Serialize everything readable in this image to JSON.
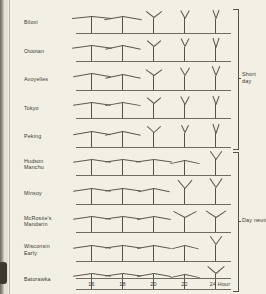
{
  "figure": {
    "x_axis": {
      "label": "Hour",
      "ticks": [
        "16",
        "18",
        "20",
        "22",
        "24"
      ],
      "tick_positions": [
        16,
        18,
        20,
        22,
        24
      ]
    },
    "groups": [
      {
        "id": "short-day",
        "label": "Short\nday",
        "label_line1": "Short",
        "label_line2": "day",
        "row_start": 0,
        "row_end": 4
      },
      {
        "id": "day-neutral",
        "label": "Day neutral",
        "label_line1": "Day neutral",
        "label_line2": "",
        "row_start": 5,
        "row_end": 9
      }
    ],
    "rows": [
      {
        "name": "Biloxi",
        "lines": [
          "Biloxi"
        ],
        "group": "short-day"
      },
      {
        "name": "Otootan",
        "lines": [
          "Otootan"
        ],
        "group": "short-day"
      },
      {
        "name": "Avoyelles",
        "lines": [
          "Avoyelles"
        ],
        "group": "short-day"
      },
      {
        "name": "Tokyo",
        "lines": [
          "Tokyo"
        ],
        "group": "short-day"
      },
      {
        "name": "Peking",
        "lines": [
          "Peking"
        ],
        "group": "short-day"
      },
      {
        "name": "Hudson Manchu",
        "lines": [
          "Hudson",
          "Manchu"
        ],
        "group": "day-neutral"
      },
      {
        "name": "Minsoy",
        "lines": [
          "Minsoy"
        ],
        "group": "day-neutral"
      },
      {
        "name": "McRostie's Mandarin",
        "lines": [
          "McRostie's",
          "Mandarin"
        ],
        "group": "day-neutral"
      },
      {
        "name": "Wisconsin Early",
        "lines": [
          "Wisconsin",
          "Early"
        ],
        "group": "day-neutral"
      },
      {
        "name": "Batorawka",
        "lines": [
          "Batorawka"
        ],
        "group": "day-neutral"
      }
    ]
  },
  "chart_data": {
    "type": "scatter",
    "title": "",
    "subtitle": "",
    "xlabel": "Hour",
    "ylabel": "",
    "x": [
      16,
      18,
      20,
      22,
      24
    ],
    "xticklabels": [
      "16",
      "18",
      "20",
      "22",
      "24"
    ],
    "xlim": [
      15,
      25
    ],
    "grid": false,
    "legend": "none",
    "note": "Plant-habit pictograms: each glyph shows stem height and branch spread for one soybean variety grown under the given photoperiod (hours of daylight). Values: height = relative stem height (0-1), spread = relative branch half-width (0-1), droop = branch tip angle below horizontal in degrees (negative = branches raised upward).",
    "categories": [
      "Biloxi",
      "Otootan",
      "Avoyelles",
      "Tokyo",
      "Peking",
      "Hudson Manchu",
      "Minsoy",
      "McRostie's Mandarin",
      "Wisconsin Early",
      "Batorawka"
    ],
    "series": [
      {
        "name": "Biloxi",
        "group": "short day",
        "height": [
          0.95,
          0.92,
          0.86,
          0.84,
          0.82
        ],
        "spread": [
          1.0,
          0.92,
          0.38,
          0.2,
          0.16
        ],
        "droop": [
          6,
          10,
          -38,
          -62,
          -70
        ]
      },
      {
        "name": "Otootan",
        "group": "short day",
        "height": [
          0.93,
          0.9,
          0.85,
          0.83,
          0.81
        ],
        "spread": [
          0.98,
          0.9,
          0.36,
          0.19,
          0.15
        ],
        "droop": [
          8,
          12,
          -40,
          -64,
          -72
        ]
      },
      {
        "name": "Avoyelles",
        "group": "short day",
        "height": [
          0.92,
          0.9,
          0.84,
          0.82,
          0.8
        ],
        "spread": [
          0.96,
          0.88,
          0.4,
          0.22,
          0.18
        ],
        "droop": [
          10,
          12,
          -36,
          -60,
          -68
        ]
      },
      {
        "name": "Tokyo",
        "group": "short day",
        "height": [
          0.92,
          0.9,
          0.84,
          0.82,
          0.8
        ],
        "spread": [
          0.95,
          0.88,
          0.36,
          0.2,
          0.16
        ],
        "droop": [
          8,
          10,
          -40,
          -62,
          -70
        ]
      },
      {
        "name": "Peking",
        "group": "short day",
        "height": [
          0.9,
          0.89,
          0.83,
          0.8,
          0.78
        ],
        "spread": [
          0.94,
          0.86,
          0.34,
          0.18,
          0.15
        ],
        "droop": [
          10,
          12,
          -42,
          -64,
          -72
        ]
      },
      {
        "name": "Hudson Manchu",
        "group": "day neutral",
        "height": [
          0.9,
          0.9,
          0.89,
          0.88,
          0.92
        ],
        "spread": [
          0.92,
          0.9,
          0.88,
          0.72,
          0.3
        ],
        "droop": [
          8,
          8,
          8,
          12,
          -55
        ]
      },
      {
        "name": "Minsoy",
        "group": "day neutral",
        "height": [
          0.9,
          0.9,
          0.89,
          0.9,
          0.92
        ],
        "spread": [
          0.92,
          0.9,
          0.8,
          0.34,
          0.3
        ],
        "droop": [
          8,
          8,
          12,
          -50,
          -56
        ]
      },
      {
        "name": "McRostie's Mandarin",
        "group": "day neutral",
        "height": [
          0.9,
          0.9,
          0.89,
          0.86,
          0.86
        ],
        "spread": [
          0.92,
          0.9,
          0.86,
          0.56,
          0.48
        ],
        "droop": [
          8,
          8,
          10,
          -28,
          -34
        ]
      },
      {
        "name": "Wisconsin Early",
        "group": "day neutral",
        "height": [
          0.9,
          0.9,
          0.89,
          0.88,
          0.92
        ],
        "spread": [
          0.92,
          0.9,
          0.86,
          0.7,
          0.3
        ],
        "droop": [
          8,
          8,
          10,
          14,
          -55
        ]
      },
      {
        "name": "Batorawka",
        "group": "day neutral",
        "height": [
          0.9,
          0.9,
          0.89,
          0.88,
          0.9
        ],
        "spread": [
          0.92,
          0.9,
          0.86,
          0.72,
          0.44
        ],
        "droop": [
          8,
          8,
          10,
          12,
          -40
        ]
      }
    ]
  }
}
